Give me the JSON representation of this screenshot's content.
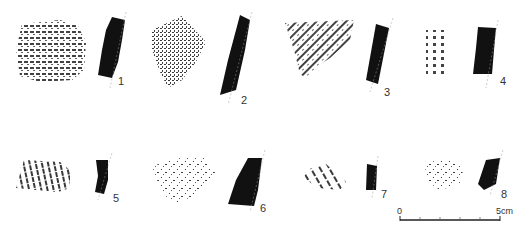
{
  "figure": {
    "type": "archaeological pottery sherd illustration",
    "sherds": [
      {
        "number": "1",
        "decoration": "horizontal incised lines"
      },
      {
        "number": "2",
        "decoration": "dense punctate/comb impressions"
      },
      {
        "number": "3",
        "decoration": "diagonal comb impressions"
      },
      {
        "number": "4",
        "decoration": "rows of stamped impressions"
      },
      {
        "number": "5",
        "decoration": "vertical incised lines"
      },
      {
        "number": "6",
        "decoration": "incised chevron / triangle pattern"
      },
      {
        "number": "7",
        "decoration": "diagonal incised lines"
      },
      {
        "number": "8",
        "decoration": "scattered impressions"
      }
    ],
    "scale_bar": {
      "start_label": "0",
      "end_label": "5cm",
      "divisions": 5
    },
    "colors": {
      "profile_fill": "#111111",
      "background": "#ffffff",
      "ink": "#1a1a1a"
    }
  }
}
